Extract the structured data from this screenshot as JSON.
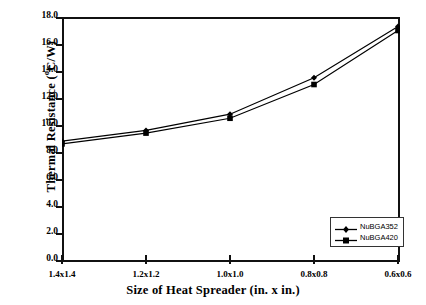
{
  "chart_data": {
    "type": "line",
    "title": "",
    "xlabel": "Size of Heat Spreader (in. x in.)",
    "ylabel": "Thermal Resistance (°C/W)",
    "categories": [
      "1.4x1.4",
      "1.2x1.2",
      "1.0x1.0",
      "0.8x0.8",
      "0.6x0.6"
    ],
    "series": [
      {
        "name": "NuBGA352",
        "marker": "diamond",
        "color": "#000000",
        "values": [
          8.8,
          9.6,
          10.8,
          13.5,
          17.3
        ]
      },
      {
        "name": "NuBGA420",
        "marker": "square",
        "color": "#000000",
        "values": [
          8.6,
          9.4,
          10.5,
          13.0,
          17.0
        ]
      }
    ],
    "ylim": [
      0.0,
      18.0
    ],
    "yticks": [
      "0.0",
      "2.0",
      "4.0",
      "6.0",
      "8.0",
      "10.0",
      "12.0",
      "14.0",
      "16.0",
      "18.0"
    ],
    "ytick_values": [
      0.0,
      2.0,
      4.0,
      6.0,
      8.0,
      10.0,
      12.0,
      14.0,
      16.0,
      18.0
    ],
    "grid": false,
    "legend_position": "lower-right",
    "frame": "box"
  },
  "axis": {
    "ylabel_main": "Thermal Resistance (",
    "ylabel_sup": "o",
    "ylabel_tail": "C/W)",
    "xlabel": "Size of Heat Spreader (in. x in.)"
  },
  "legend": {
    "items": [
      {
        "label": "NuBGA352",
        "marker": "diamond"
      },
      {
        "label": "NuBGA420",
        "marker": "square"
      }
    ]
  }
}
